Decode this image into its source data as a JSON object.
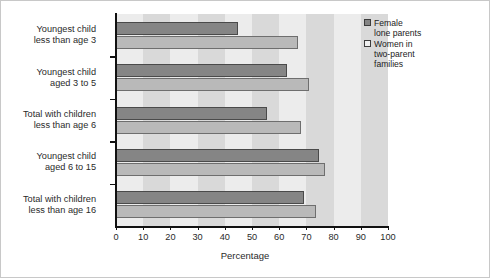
{
  "chart_data": {
    "type": "bar",
    "orientation": "horizontal",
    "title": "",
    "xlabel": "Percentage",
    "ylabel": "",
    "xlim": [
      0,
      100
    ],
    "xticks": [
      0,
      10,
      20,
      30,
      40,
      50,
      60,
      70,
      80,
      90,
      100
    ],
    "grid": "vertical-bands",
    "legend_position": "top-right",
    "categories": [
      "Youngest child\nless than age 3",
      "Youngest child\naged 3 to 5",
      "Total with children\nless than age 6",
      "Youngest child\naged 6 to 15",
      "Total with children\nless than age 16"
    ],
    "series": [
      {
        "name": "Female\nlone parents",
        "color": "#858585",
        "values": [
          45,
          63,
          55.5,
          74.5,
          69
        ]
      },
      {
        "name": "Women in\ntwo-parent\nfamilies",
        "color": "#b9b9b9",
        "values": [
          67,
          71,
          68,
          77,
          73.5
        ]
      }
    ]
  },
  "legend": {
    "items": [
      {
        "label": "Female\nlone parents",
        "swatch": "dark"
      },
      {
        "label": "Women in\ntwo-parent\nfamilies",
        "swatch": "light"
      }
    ]
  },
  "axis": {
    "x_title": "Percentage",
    "tick_labels": [
      "0",
      "10",
      "20",
      "30",
      "40",
      "50",
      "60",
      "70",
      "80",
      "90",
      "100"
    ]
  },
  "colors": {
    "series_dark": "#858585",
    "series_light": "#b9b9b9",
    "band_light": "#ececec",
    "band_dark": "#d9d9d9",
    "axis": "#111111"
  }
}
